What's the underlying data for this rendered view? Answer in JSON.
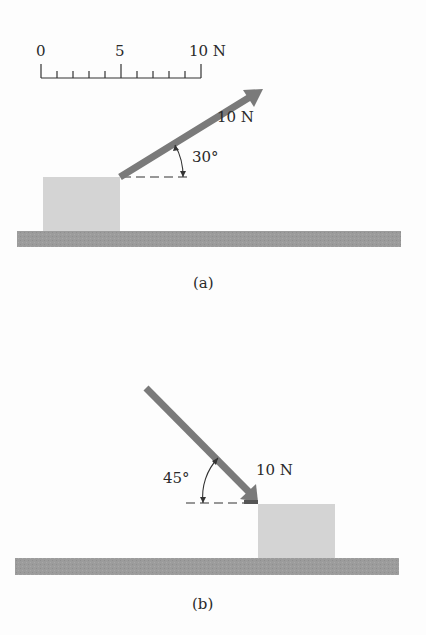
{
  "scale": {
    "labels": [
      "0",
      "5",
      "10 N"
    ],
    "min": 0,
    "max": 10,
    "unit": "N",
    "minor_ticks": 10
  },
  "part_a": {
    "caption": "(a)",
    "force_label": "10 N",
    "angle_label": "30°",
    "angle_deg": 30,
    "direction": "up-right from top-right corner of block"
  },
  "part_b": {
    "caption": "(b)",
    "force_label": "10 N",
    "angle_label": "45°",
    "angle_deg": 45,
    "direction": "down-right onto top-left corner of block"
  },
  "colors": {
    "arrow": "#7a7a7a",
    "block": "#d4d4d4",
    "ground": "#9a9a9a",
    "text": "#2a2a2a"
  }
}
